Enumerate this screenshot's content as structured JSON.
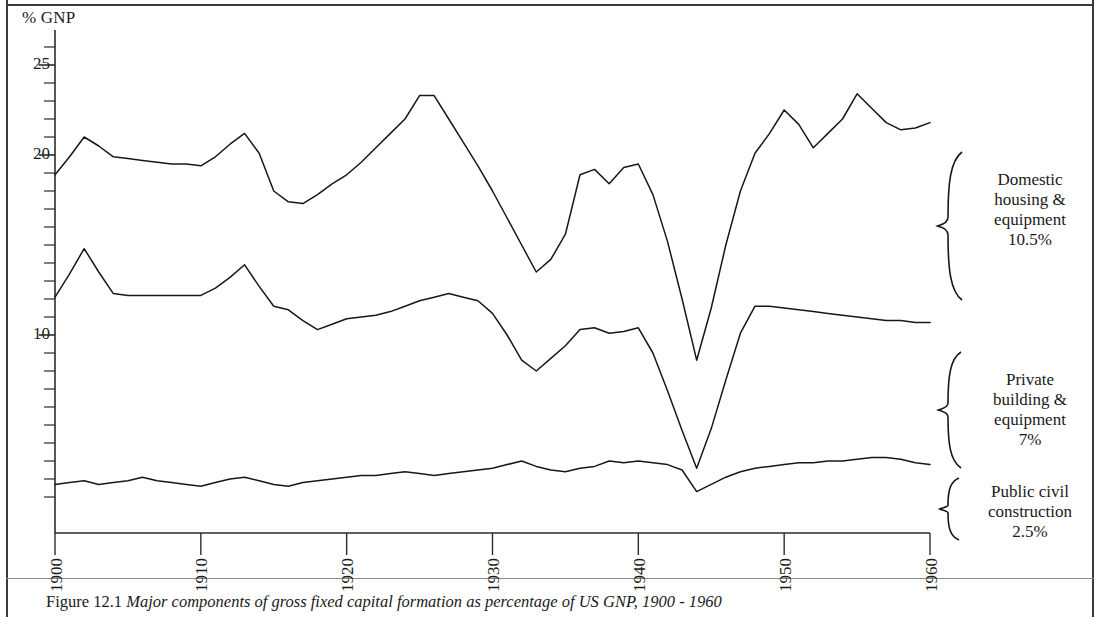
{
  "figure": {
    "axis_unit_label": "% GNP",
    "caption_number": "Figure 12.1",
    "caption_text": "Major components of gross fixed capital formation as percentage of US GNP, 1900 - 1960"
  },
  "legend": [
    {
      "name": "domestic-housing-equipment",
      "line1": "Domestic",
      "line2": "housing &",
      "line3": "equipment",
      "value": "10.5%"
    },
    {
      "name": "private-building-equipment",
      "line1": "Private",
      "line2": "building &",
      "line3": "equipment",
      "value": "7%"
    },
    {
      "name": "public-civil-construction",
      "line1": "Public civil",
      "line2": "construction",
      "line3": "",
      "value": "2.5%"
    }
  ],
  "axes": {
    "y_tick_labels": [
      "25",
      "20",
      "10"
    ],
    "y_tick_values": [
      25,
      20,
      10
    ],
    "x_tick_labels": [
      "1900",
      "1910",
      "1920",
      "1930",
      "1940",
      "1950",
      "1960"
    ],
    "x_tick_values": [
      1900,
      1910,
      1920,
      1930,
      1940,
      1950,
      1960
    ]
  },
  "chart_data": {
    "type": "line",
    "title": "Major components of gross fixed capital formation as percentage of US GNP, 1900 - 1960",
    "xlabel": "",
    "ylabel": "% GNP",
    "xlim": [
      1900,
      1960
    ],
    "ylim": [
      0,
      26
    ],
    "grid": false,
    "legend_position": "right",
    "y_major_ticks": [
      10,
      20,
      25
    ],
    "y_minor_tick_interval": 1,
    "x_major_ticks": [
      1900,
      1910,
      1920,
      1930,
      1940,
      1950,
      1960
    ],
    "note": "Cumulative (stacked) boundary lines. Top line = total of all three components; middle line = public civil construction + private building & equipment; bottom line = public civil construction.",
    "x": [
      1900,
      1901,
      1902,
      1903,
      1904,
      1905,
      1906,
      1907,
      1908,
      1909,
      1910,
      1911,
      1912,
      1913,
      1914,
      1915,
      1916,
      1917,
      1918,
      1919,
      1920,
      1921,
      1922,
      1923,
      1924,
      1925,
      1926,
      1927,
      1928,
      1929,
      1930,
      1931,
      1932,
      1933,
      1934,
      1935,
      1936,
      1937,
      1938,
      1939,
      1940,
      1941,
      1942,
      1943,
      1944,
      1945,
      1946,
      1947,
      1948,
      1949,
      1950,
      1951,
      1952,
      1953,
      1954,
      1955,
      1956,
      1957,
      1958,
      1959,
      1960
    ],
    "series": [
      {
        "name": "Total (top boundary line)",
        "values": [
          18.9,
          19.9,
          21.0,
          20.5,
          19.9,
          19.8,
          19.7,
          19.6,
          19.5,
          19.5,
          19.4,
          19.9,
          20.6,
          21.2,
          20.1,
          18.0,
          17.4,
          17.3,
          17.8,
          18.4,
          18.9,
          19.6,
          20.4,
          21.2,
          22.0,
          23.3,
          23.3,
          22.0,
          20.7,
          19.4,
          18.0,
          16.5,
          15.0,
          13.5,
          14.2,
          15.6,
          18.9,
          19.2,
          18.4,
          19.3,
          19.5,
          17.8,
          15.2,
          12.0,
          8.6,
          11.5,
          15.0,
          18.0,
          20.1,
          21.2,
          22.5,
          21.7,
          20.4,
          21.2,
          22.0,
          23.4,
          22.6,
          21.8,
          21.4,
          21.5,
          21.8
        ]
      },
      {
        "name": "Public civil + Private building (middle boundary line)",
        "values": [
          12.1,
          13.4,
          14.8,
          13.5,
          12.3,
          12.2,
          12.2,
          12.2,
          12.2,
          12.2,
          12.2,
          12.6,
          13.2,
          13.9,
          12.7,
          11.6,
          11.4,
          10.8,
          10.3,
          10.6,
          10.9,
          11.0,
          11.1,
          11.3,
          11.6,
          11.9,
          12.1,
          12.3,
          12.1,
          11.9,
          11.2,
          10.0,
          8.6,
          8.0,
          8.7,
          9.4,
          10.3,
          10.4,
          10.1,
          10.2,
          10.4,
          9.0,
          6.9,
          4.7,
          2.6,
          4.8,
          7.5,
          10.1,
          11.6,
          11.6,
          11.5,
          11.4,
          11.3,
          11.2,
          11.1,
          11.0,
          10.9,
          10.8,
          10.8,
          10.7,
          10.7
        ]
      },
      {
        "name": "Public civil construction (bottom boundary line)",
        "values": [
          1.7,
          1.8,
          1.9,
          1.7,
          1.8,
          1.9,
          2.1,
          1.9,
          1.8,
          1.7,
          1.6,
          1.8,
          2.0,
          2.1,
          1.9,
          1.7,
          1.6,
          1.8,
          1.9,
          2.0,
          2.1,
          2.2,
          2.2,
          2.3,
          2.4,
          2.3,
          2.2,
          2.3,
          2.4,
          2.5,
          2.6,
          2.8,
          3.0,
          2.7,
          2.5,
          2.4,
          2.6,
          2.7,
          3.0,
          2.9,
          3.0,
          2.9,
          2.8,
          2.5,
          1.3,
          1.7,
          2.1,
          2.4,
          2.6,
          2.7,
          2.8,
          2.9,
          2.9,
          3.0,
          3.0,
          3.1,
          3.2,
          3.2,
          3.1,
          2.9,
          2.8
        ]
      }
    ]
  }
}
